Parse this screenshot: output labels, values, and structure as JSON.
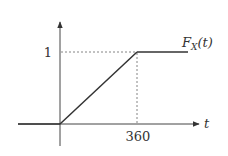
{
  "diagram": {
    "type": "cdf-plot",
    "function_label": {
      "main": "F",
      "subscript": "X",
      "argument": "(t)"
    },
    "x_axis_label": "t",
    "y_tick_label": "1",
    "x_tick_label": "360",
    "y_tick_value": 1,
    "x_tick_value": 360,
    "segments": [
      {
        "from": [
          "-inf",
          0
        ],
        "to": [
          0,
          0
        ]
      },
      {
        "from": [
          0,
          0
        ],
        "to": [
          360,
          1
        ]
      },
      {
        "from": [
          360,
          1
        ],
        "to": [
          "+inf",
          1
        ]
      }
    ],
    "colors": {
      "curve": "#333333",
      "axes": "#444444",
      "guides": "#666666"
    }
  }
}
